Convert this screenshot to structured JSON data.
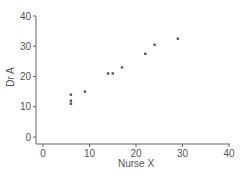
{
  "chart_data": {
    "type": "scatter",
    "title": "",
    "xlabel": "Nurse X",
    "ylabel": "Dr A",
    "xlim": [
      0,
      40
    ],
    "ylim": [
      0,
      40
    ],
    "xticks": [
      0,
      10,
      20,
      30,
      40
    ],
    "yticks": [
      0,
      10,
      20,
      30,
      40
    ],
    "grid": false,
    "legend": null,
    "points": [
      {
        "x": 6,
        "y": 14
      },
      {
        "x": 6,
        "y": 12
      },
      {
        "x": 6,
        "y": 11
      },
      {
        "x": 9,
        "y": 15
      },
      {
        "x": 14,
        "y": 21
      },
      {
        "x": 15,
        "y": 21
      },
      {
        "x": 17,
        "y": 23
      },
      {
        "x": 22,
        "y": 27.5
      },
      {
        "x": 24,
        "y": 30.5
      },
      {
        "x": 29,
        "y": 32.5
      }
    ]
  },
  "colors": {
    "axis": "#666666",
    "marker": "#555555",
    "text": "#555555"
  }
}
